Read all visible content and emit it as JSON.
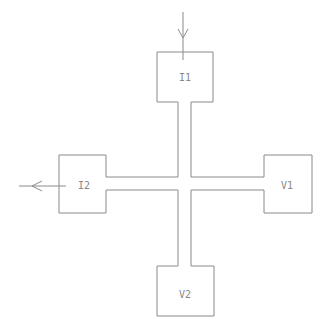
{
  "diagram": {
    "type": "cross-shaped four-terminal device",
    "stroke_color": "#8a8a8a",
    "background": "#ffffff",
    "pads": [
      {
        "id": "I1",
        "label": "I1",
        "position": "top"
      },
      {
        "id": "I2",
        "label": "I2",
        "position": "left"
      },
      {
        "id": "V1",
        "label": "V1",
        "position": "right"
      },
      {
        "id": "V2",
        "label": "V2",
        "position": "bottom"
      }
    ],
    "arrows": [
      {
        "name": "current-in-arrow",
        "attached_to": "I1",
        "direction": "down"
      },
      {
        "name": "current-out-arrow",
        "attached_to": "I2",
        "direction": "left"
      }
    ]
  }
}
